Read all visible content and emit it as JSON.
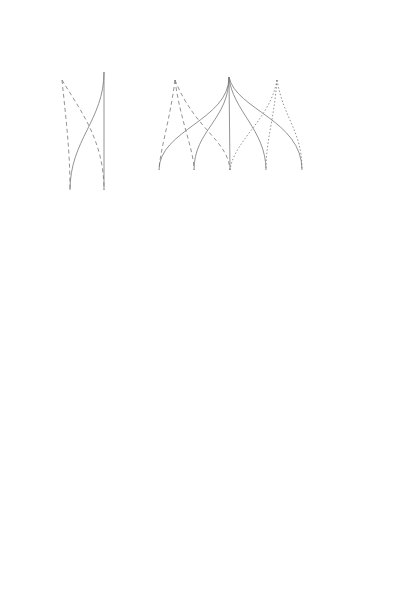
{
  "header": {
    "right_label": "應用方式",
    "top_labels": [
      {
        "text": "醪／\n混合介質",
        "x": 60
      },
      {
        "text": "鮮味強烈\n的調味料",
        "x": 108
      },
      {
        "text": "快速增進鮮\n味的方法",
        "x": 170
      },
      {
        "text": "覆蓋食\n材表層",
        "x": 229
      },
      {
        "text": "協助長\n期熟成",
        "x": 282
      }
    ]
  },
  "rows": [
    {
      "label": "發酵",
      "y": 216
    },
    {
      "label": "時間",
      "y": 289
    },
    {
      "label": "糖",
      "y": 362
    },
    {
      "label": "水",
      "y": 435
    },
    {
      "label": "鹽",
      "y": 508
    }
  ],
  "footer": {
    "right_label": "製品",
    "products": [
      {
        "text": "胺基酸\n醬汁",
        "x": 70
      },
      {
        "text": "胺基酸\n糊醬",
        "x": 111
      },
      {
        "text": "甘酒",
        "x": 159
      },
      {
        "text": "甘麴",
        "x": 194
      },
      {
        "text": "鹽麴",
        "x": 230
      },
      {
        "text": "直接\n使用",
        "x": 266
      },
      {
        "text": "麴",
        "x": 302
      }
    ]
  },
  "columns": [
    {
      "x": 70,
      "widths": [
        17,
        15,
        1,
        17,
        3
      ]
    },
    {
      "x": 104,
      "widths": [
        17,
        12,
        2,
        5,
        2
      ]
    },
    {
      "x": 159,
      "widths": [
        9,
        2,
        4,
        17,
        0
      ]
    },
    {
      "x": 194,
      "widths": [
        5,
        1,
        14,
        13,
        0
      ]
    },
    {
      "x": 230,
      "widths": [
        2,
        1,
        2,
        16,
        3
      ]
    },
    {
      "x": 266,
      "widths": [
        0,
        0,
        1,
        2,
        0
      ]
    },
    {
      "x": 302,
      "widths": [
        0,
        0,
        2,
        2,
        0
      ]
    }
  ],
  "colors": {
    "line": "#666666",
    "fill": "#e6e6e6",
    "grid": "#999999"
  }
}
